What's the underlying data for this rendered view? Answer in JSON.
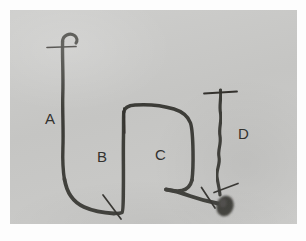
{
  "figure": {
    "kind": "grayscale-specimen-photograph",
    "background_color": "#fdfdfd",
    "plate_color": "#c9c9c7",
    "ink_color": "#3a3935",
    "label_color": "#33322f",
    "plate": {
      "x": 10,
      "y": 10,
      "width": 287,
      "height": 214
    }
  },
  "labels": [
    {
      "id": "A",
      "text": "A",
      "x": 45,
      "y": 111
    },
    {
      "id": "B",
      "text": "B",
      "x": 97,
      "y": 149
    },
    {
      "id": "C",
      "text": "C",
      "x": 155,
      "y": 147
    },
    {
      "id": "D",
      "text": "D",
      "x": 238,
      "y": 126
    }
  ],
  "structures": [
    {
      "id": "segment-a",
      "label": "A",
      "description": "long vertical tube with shepherd's-crook hook at top, descending to a rounded U-bend at bottom left"
    },
    {
      "id": "segment-b",
      "label": "B",
      "description": "vertical tube ascending from the U-bend on the right side of the loop"
    },
    {
      "id": "segment-c",
      "label": "C",
      "description": "arched horizontal tube running right from the top of B, curving down at the right"
    },
    {
      "id": "segment-d",
      "label": "D",
      "description": "wavy vertical tube descending from a horizontal tick to the bulbous terminal mass"
    }
  ],
  "tick_marks": [
    {
      "id": "tick-a-top",
      "orientation": "horizontal",
      "x1": 38,
      "y1": 37,
      "x2": 66,
      "y2": 37
    },
    {
      "id": "tick-b-bottom",
      "orientation": "diagonal",
      "x1": 93,
      "y1": 185,
      "x2": 111,
      "y2": 209
    },
    {
      "id": "tick-c-left",
      "orientation": "vertical",
      "x1": 114,
      "y1": 98,
      "x2": 114,
      "y2": 123
    },
    {
      "id": "tick-d-top",
      "orientation": "horizontal",
      "x1": 195,
      "y1": 83,
      "x2": 226,
      "y2": 82
    },
    {
      "id": "tick-d-lower-right",
      "orientation": "diagonal",
      "x1": 205,
      "y1": 182,
      "x2": 227,
      "y2": 174
    },
    {
      "id": "tick-d-lower-left",
      "orientation": "diagonal",
      "x1": 192,
      "y1": 178,
      "x2": 205,
      "y2": 197
    }
  ],
  "terminal_mass": {
    "id": "terminal-bulb",
    "cx": 215,
    "cy": 196,
    "rx": 8,
    "ry": 10
  }
}
